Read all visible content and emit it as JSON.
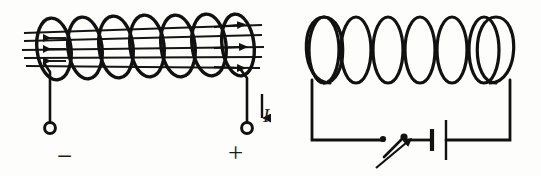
{
  "figure": {
    "background_color": "#fdfdfc",
    "ink_color": "#1a1a1a",
    "width": 541,
    "height": 176
  },
  "left_panel": {
    "name": "solenoid-with-field-lines",
    "coil": {
      "turns": 7,
      "style": "helical-ellipses",
      "x_start": 36,
      "x_end": 252,
      "center_y": 49
    },
    "field_lines": {
      "count": 5,
      "direction": "horizontal",
      "left_arrow_count": 3,
      "left_arrow_direction": "left",
      "right_arrow_count": 3,
      "right_arrow_direction": "right",
      "top_y": 32,
      "bottom_y": 66
    },
    "terminals": [
      {
        "id": "negative-terminal",
        "sign": "−",
        "x": 50,
        "y": 130
      },
      {
        "id": "positive-terminal",
        "sign": "+",
        "x": 247,
        "y": 130
      }
    ],
    "current_arrow": {
      "label": "I",
      "direction": "down",
      "x": 262,
      "y_top": 96,
      "y_bottom": 122
    }
  },
  "right_panel": {
    "name": "solenoid-battery-circuit",
    "coil": {
      "turns": 7,
      "style": "vertical-loops",
      "x_start": 305,
      "x_end": 517,
      "top_y": 17,
      "bottom_y": 83
    },
    "circuit": {
      "left_wire_x": 312,
      "right_wire_x": 510,
      "bottom_wire_y": 140
    },
    "switch": {
      "name": "circuit-switch",
      "state": "open",
      "left_contact_x": 382,
      "right_contact_x": 404,
      "pointer_arrow": true
    },
    "battery": {
      "name": "battery-symbol",
      "negative_plate_x": 432,
      "positive_plate_x": 446,
      "plate_center_y": 140
    }
  },
  "labels": {
    "minus": "−",
    "plus": "+",
    "current": "I"
  }
}
